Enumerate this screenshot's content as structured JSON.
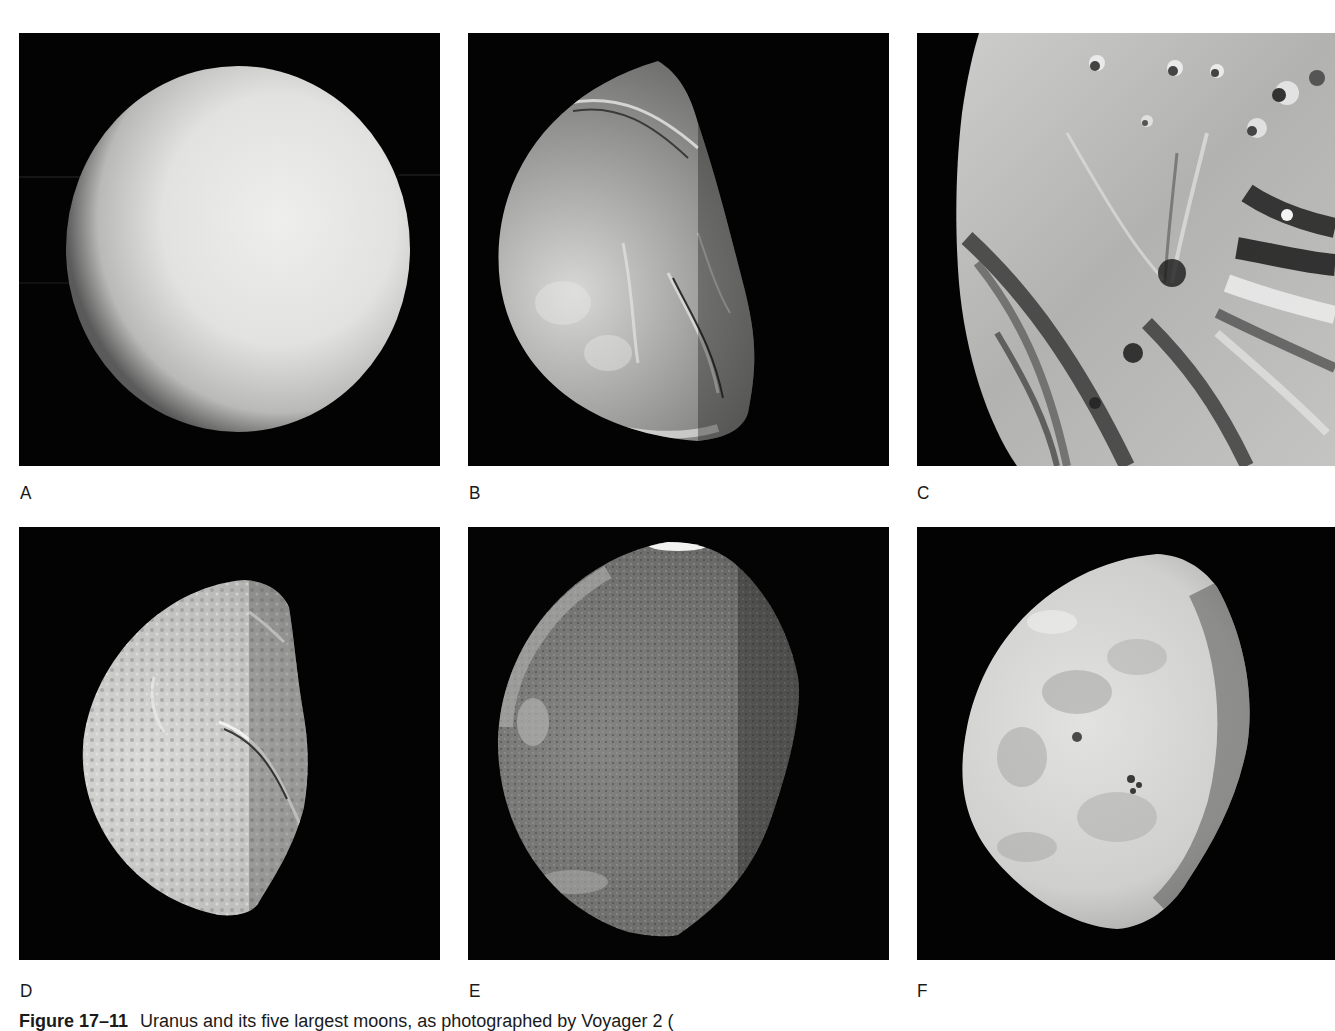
{
  "figure": {
    "caption_label": "Figure 17–11",
    "caption_text": "Uranus and its five largest moons, as photographed by Voyager 2 (",
    "background_color": "#ffffff",
    "panel_background_color": "#030303"
  },
  "panels": [
    {
      "label": "A",
      "subject_shape": "smooth-planet-disk",
      "tone": "pale-gray",
      "lighting": "full disk, limb-darkened lower-left"
    },
    {
      "label": "B",
      "subject_shape": "gibbous-moon-grooved",
      "tone": "mid-gray",
      "lighting": "lit from left, terminator right"
    },
    {
      "label": "C",
      "subject_shape": "moon-closeup-chevron-terrain",
      "tone": "light-gray striated",
      "lighting": "limb along left edge, cropped right"
    },
    {
      "label": "D",
      "subject_shape": "half-moon-cratered-canyons",
      "tone": "light-gray",
      "lighting": "lit from left, terminator right"
    },
    {
      "label": "E",
      "subject_shape": "gibbous-moon-dark",
      "tone": "dark-gray",
      "lighting": "lit from left, bright ring at top"
    },
    {
      "label": "F",
      "subject_shape": "gibbous-moon-mottled",
      "tone": "pale-gray mottled",
      "lighting": "lit from left, terminator right"
    }
  ]
}
